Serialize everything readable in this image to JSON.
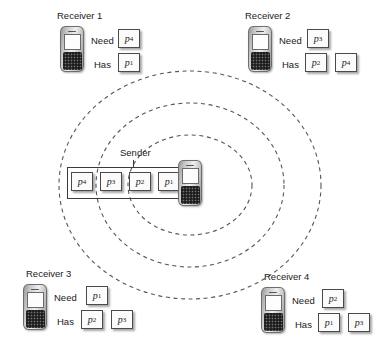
{
  "diagram": {
    "sender": {
      "label": "Sender",
      "queue_label": "sender-packet-queue",
      "queue": [
        "p4",
        "p3",
        "p2",
        "p1"
      ],
      "queue_display": [
        "p",
        "p",
        "p",
        "p"
      ],
      "queue_subscripts": [
        "4",
        "3",
        "2",
        "1"
      ],
      "device_icon": "smartphone-icon"
    },
    "rings": {
      "count": 3,
      "style": "dashed",
      "color": "#555555",
      "center_x": 190,
      "center_y": 185,
      "radii_x": [
        62,
        94,
        131
      ],
      "radii_y": [
        50,
        82,
        114
      ]
    },
    "receivers": [
      {
        "id": "receiver-1",
        "title": "Receiver 1",
        "need_label": "Need",
        "has_label": "Has",
        "need": [
          "p4"
        ],
        "need_display": [
          {
            "base": "p",
            "sub": "4"
          }
        ],
        "has": [
          "p1"
        ],
        "has_display": [
          {
            "base": "p",
            "sub": "1"
          }
        ],
        "device_icon": "smartphone-icon"
      },
      {
        "id": "receiver-2",
        "title": "Receiver 2",
        "need_label": "Need",
        "has_label": "Has",
        "need": [
          "p3"
        ],
        "need_display": [
          {
            "base": "p",
            "sub": "3"
          }
        ],
        "has": [
          "p2",
          "p4"
        ],
        "has_display": [
          {
            "base": "p",
            "sub": "2"
          },
          {
            "base": "p",
            "sub": "4"
          }
        ],
        "device_icon": "smartphone-icon"
      },
      {
        "id": "receiver-3",
        "title": "Receiver 3",
        "need_label": "Need",
        "has_label": "Has",
        "need": [
          "p1"
        ],
        "need_display": [
          {
            "base": "p",
            "sub": "1"
          }
        ],
        "has": [
          "p2",
          "p3"
        ],
        "has_display": [
          {
            "base": "p",
            "sub": "2"
          },
          {
            "base": "p",
            "sub": "3"
          }
        ],
        "device_icon": "smartphone-icon"
      },
      {
        "id": "receiver-4",
        "title": "Receiver 4",
        "need_label": "Need",
        "has_label": "Has",
        "need": [
          "p2"
        ],
        "need_display": [
          {
            "base": "p",
            "sub": "2"
          }
        ],
        "has": [
          "p1",
          "p3"
        ],
        "has_display": [
          {
            "base": "p",
            "sub": "1"
          },
          {
            "base": "p",
            "sub": "3"
          }
        ],
        "device_icon": "smartphone-icon"
      }
    ]
  }
}
